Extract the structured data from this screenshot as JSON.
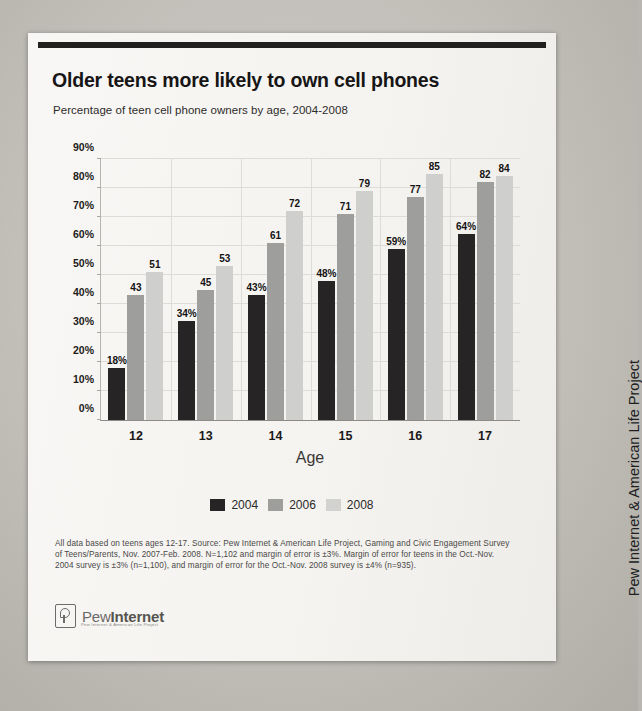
{
  "document": {
    "side_caption": "Pew Internet & American Life Project"
  },
  "report": {
    "title": "Older teens more likely to own cell phones",
    "subtitle": "Percentage of teen cell phone owners by age, 2004-2008",
    "footnote": "All data based on teens ages 12-17. Source: Pew Internet & American Life Project, Gaming and Civic Engagement Survey of Teens/Parents, Nov. 2007-Feb. 2008. N=1,102 and margin of error is ±3%. Margin of error for teens in the Oct.-Nov. 2004 survey is ±3% (n=1,100), and margin of error for the Oct.-Nov. 2008 survey is ±4% (n=935).",
    "logo": {
      "name_light": "Pew",
      "name_bold": "Internet",
      "tagline": "Pew Internet & American Life Project"
    }
  },
  "chart_data": {
    "type": "bar",
    "title": "Older teens more likely to own cell phones",
    "subtitle": "Percentage of teen cell phone owners by age, 2004-2008",
    "xlabel": "Age",
    "ylabel": "",
    "categories": [
      "12",
      "13",
      "14",
      "15",
      "16",
      "17"
    ],
    "ylim": [
      0,
      90
    ],
    "yticks": [
      "0%",
      "10%",
      "20%",
      "30%",
      "40%",
      "50%",
      "60%",
      "70%",
      "80%",
      "90%"
    ],
    "ytick_values": [
      0,
      10,
      20,
      30,
      40,
      50,
      60,
      70,
      80,
      90
    ],
    "grid": true,
    "legend_position": "bottom",
    "series": [
      {
        "name": "2004",
        "color": "#262425",
        "values": [
          18,
          34,
          43,
          48,
          59,
          64
        ],
        "labels": [
          "18%",
          "34%",
          "43%",
          "48%",
          "59%",
          "64%"
        ]
      },
      {
        "name": "2006",
        "color": "#9e9e9c",
        "values": [
          43,
          45,
          61,
          71,
          77,
          82
        ],
        "labels": [
          "43",
          "45",
          "61",
          "71",
          "77",
          "82"
        ]
      },
      {
        "name": "2008",
        "color": "#cfcfcd",
        "values": [
          51,
          53,
          72,
          79,
          85,
          84
        ],
        "labels": [
          "51",
          "53",
          "72",
          "79",
          "85",
          "84"
        ]
      }
    ]
  }
}
